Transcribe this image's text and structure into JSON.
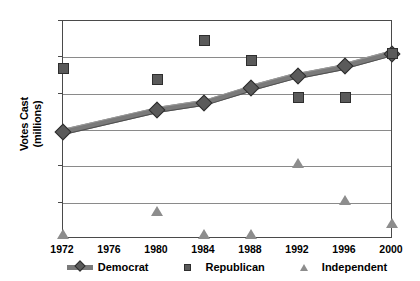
{
  "chart_data": {
    "type": "scatter",
    "title": "",
    "xlabel": "",
    "ylabel": "Votes Cast (millions)",
    "ylabel_line1": "Votes Cast",
    "ylabel_line2": "(millions)",
    "categories": [
      "1972",
      "1976",
      "1980",
      "1984",
      "1988",
      "1992",
      "1996",
      "2000"
    ],
    "x_tick_labels": [
      "1972",
      "1976",
      "1980",
      "1984",
      "1988",
      "1992",
      "1996",
      "2000"
    ],
    "y_tick_labels": [
      "60",
      "50",
      "40",
      "30",
      "20",
      "10",
      "0"
    ],
    "ylim": [
      0,
      60
    ],
    "y_major_step": 10,
    "grid": true,
    "legend_position": "bottom",
    "series": [
      {
        "name": "Democrat",
        "marker": "diamond-line",
        "color": "#5a5a5a",
        "values": [
          29.5,
          null,
          35.5,
          37.5,
          41.5,
          45.0,
          47.5,
          51.0
        ]
      },
      {
        "name": "Republican",
        "marker": "square",
        "color": "#5a5a5a",
        "values": [
          47.0,
          null,
          44.0,
          54.5,
          49.0,
          39.0,
          39.0,
          51.0
        ]
      },
      {
        "name": "Independent",
        "marker": "triangle",
        "color": "#8d8d8d",
        "values": [
          0.5,
          null,
          7.0,
          0.5,
          0.5,
          20.0,
          10.0,
          3.5
        ]
      }
    ]
  },
  "legend": {
    "items": [
      {
        "label": "Democrat",
        "key": "line-diamond-marker"
      },
      {
        "label": "Republican",
        "key": "square-marker"
      },
      {
        "label": "Independent",
        "key": "triangle-marker"
      }
    ]
  }
}
